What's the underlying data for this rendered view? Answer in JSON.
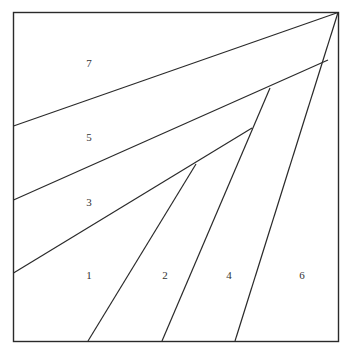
{
  "diagram": {
    "type": "log-cabin-style quilt block diagram (piecing order)",
    "stroke_color": "#2a2a2a",
    "background": "#ffffff",
    "pieces": [
      {
        "label": "1",
        "x": 89,
        "y": 275
      },
      {
        "label": "2",
        "x": 165,
        "y": 275
      },
      {
        "label": "3",
        "x": 89,
        "y": 202
      },
      {
        "label": "4",
        "x": 229,
        "y": 275
      },
      {
        "label": "5",
        "x": 89,
        "y": 137
      },
      {
        "label": "6",
        "x": 302,
        "y": 275
      },
      {
        "label": "7",
        "x": 89,
        "y": 63
      }
    ]
  }
}
